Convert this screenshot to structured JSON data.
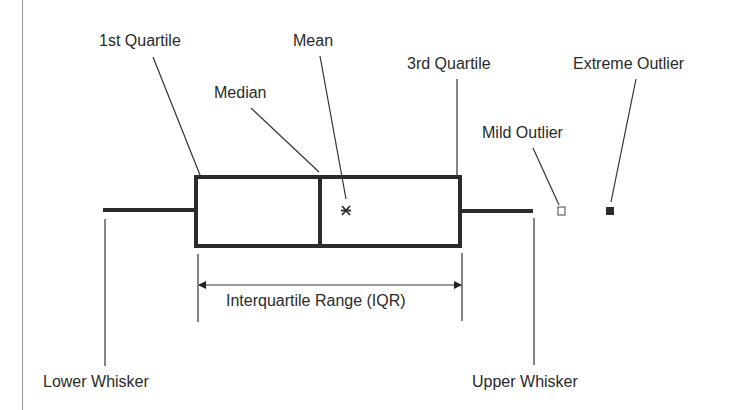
{
  "diagram": {
    "type": "box-plot-anatomy",
    "labels": {
      "first_quartile": "1st Quartile",
      "mean": "Mean",
      "median": "Median",
      "third_quartile": "3rd Quartile",
      "extreme_outlier": "Extreme Outlier",
      "mild_outlier": "Mild Outlier",
      "iqr": "Interquartile Range (IQR)",
      "lower_whisker": "Lower Whisker",
      "upper_whisker": "Upper Whisker"
    },
    "markers": {
      "mean_symbol": "asterisk-icon",
      "mild_outlier_symbol": "hollow-square-icon",
      "extreme_outlier_symbol": "filled-square-icon"
    },
    "colors": {
      "stroke": "#2b2b2b",
      "leader_line": "#333333",
      "frame": "#9a9a9a",
      "background": "#ffffff"
    }
  }
}
